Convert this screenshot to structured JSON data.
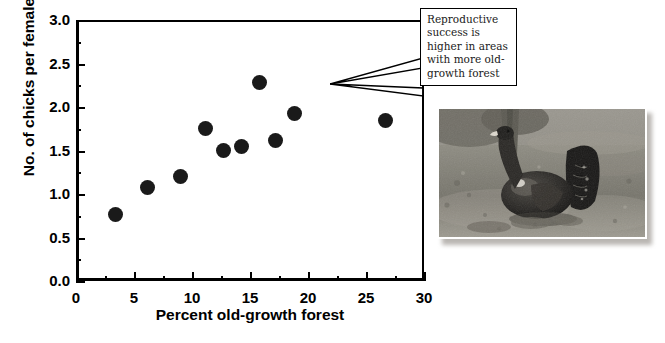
{
  "figure": {
    "caption_visible": false
  },
  "chart_data": {
    "type": "scatter",
    "title": "",
    "xlabel": "Percent old-growth forest",
    "ylabel": "No. of chicks per female",
    "xlim": [
      0,
      30
    ],
    "ylim": [
      0,
      3.0
    ],
    "xticks": [
      0,
      5,
      10,
      15,
      20,
      25,
      30
    ],
    "xticklabels": [
      "0",
      "5",
      "10",
      "15",
      "20",
      "25",
      "30"
    ],
    "x_minor_interval": 2.5,
    "yticks": [
      0.0,
      0.5,
      1.0,
      1.5,
      2.0,
      2.5,
      3.0
    ],
    "yticklabels": [
      "0.0",
      "0.5",
      "1.0",
      "1.5",
      "2.0",
      "2.5",
      "3.0"
    ],
    "grid": false,
    "legend": false,
    "marker": "filled-circle",
    "marker_color": "#1a1a1a",
    "points": [
      {
        "x": 3.4,
        "y": 0.77
      },
      {
        "x": 6.2,
        "y": 1.07
      },
      {
        "x": 9.0,
        "y": 1.2
      },
      {
        "x": 11.2,
        "y": 1.75
      },
      {
        "x": 12.7,
        "y": 1.5
      },
      {
        "x": 14.3,
        "y": 1.55
      },
      {
        "x": 15.8,
        "y": 2.28
      },
      {
        "x": 17.2,
        "y": 1.62
      },
      {
        "x": 18.8,
        "y": 1.92
      },
      {
        "x": 26.7,
        "y": 1.85
      }
    ]
  },
  "callout": {
    "text": "Reproductive success is higher in areas with more old-growth forest"
  },
  "photo": {
    "subject": "capercaillie-grouse-displaying",
    "style": "black-and-white-photograph"
  },
  "colors": {
    "ink": "#000000",
    "marker": "#1a1a1a",
    "background": "#ffffff"
  }
}
